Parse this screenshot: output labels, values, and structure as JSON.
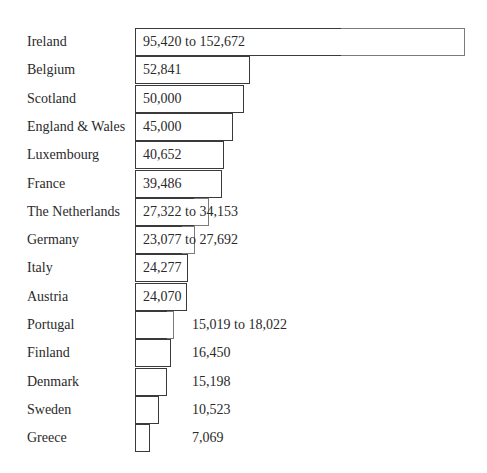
{
  "chart_data": {
    "type": "bar",
    "orientation": "horizontal",
    "title": "",
    "xlabel": "",
    "ylabel": "",
    "grid": false,
    "legend": null,
    "categories": [
      "Ireland",
      "Belgium",
      "Scotland",
      "England & Wales",
      "Luxembourg",
      "France",
      "The Netherlands",
      "Germany",
      "Italy",
      "Austria",
      "Portugal",
      "Finland",
      "Denmark",
      "Sweden",
      "Greece"
    ],
    "series": [
      {
        "name": "low",
        "values": [
          95420,
          52841,
          50000,
          45000,
          40652,
          39486,
          27322,
          23077,
          24277,
          24070,
          15019,
          16450,
          15198,
          10523,
          7069
        ]
      },
      {
        "name": "high",
        "values": [
          152672,
          52841,
          50000,
          45000,
          40652,
          39486,
          34153,
          27692,
          24277,
          24070,
          18022,
          16450,
          15198,
          10523,
          7069
        ]
      }
    ],
    "value_labels": [
      "95,420 to 152,672",
      "52,841",
      "50,000",
      "45,000",
      "40,652",
      "39,486",
      "27,322 to 34,153",
      "23,077 to 27,692",
      "24,277",
      "24,070",
      "15,019 to 18,022",
      "16,450",
      "15,198",
      "10,523",
      "7,069"
    ]
  },
  "rows": [
    {
      "label": "Ireland",
      "value": "95,420 to 152,672",
      "low_px": 207,
      "high_px": 330,
      "inside": true
    },
    {
      "label": "Belgium",
      "value": "52,841",
      "low_px": 115,
      "high_px": 115,
      "inside": true
    },
    {
      "label": "Scotland",
      "value": "50,000",
      "low_px": 109,
      "high_px": 109,
      "inside": true
    },
    {
      "label": "England & Wales",
      "value": "45,000",
      "low_px": 98,
      "high_px": 98,
      "inside": true
    },
    {
      "label": "Luxembourg",
      "value": "40,652",
      "low_px": 89,
      "high_px": 89,
      "inside": true
    },
    {
      "label": "France",
      "value": "39,486",
      "low_px": 87,
      "high_px": 87,
      "inside": true
    },
    {
      "label": "The Netherlands",
      "value": "27,322 to 34,153",
      "low_px": 60,
      "high_px": 74,
      "inside": true
    },
    {
      "label": "Germany",
      "value": "23,077 to 27,692",
      "low_px": 48,
      "high_px": 60,
      "inside": true
    },
    {
      "label": "Italy",
      "value": "24,277",
      "low_px": 53,
      "high_px": 53,
      "inside": true
    },
    {
      "label": "Austria",
      "value": "24,070",
      "low_px": 52,
      "high_px": 52,
      "inside": true
    },
    {
      "label": "Portugal",
      "value": "15,019 to 18,022",
      "low_px": 33,
      "high_px": 39,
      "inside": false
    },
    {
      "label": "Finland",
      "value": "16,450",
      "low_px": 36,
      "high_px": 36,
      "inside": false
    },
    {
      "label": "Denmark",
      "value": "15,198",
      "low_px": 32,
      "high_px": 32,
      "inside": false
    },
    {
      "label": "Sweden",
      "value": "10,523",
      "low_px": 24,
      "high_px": 24,
      "inside": false
    },
    {
      "label": "Greece",
      "value": "7,069",
      "low_px": 15,
      "high_px": 15,
      "inside": false
    }
  ]
}
